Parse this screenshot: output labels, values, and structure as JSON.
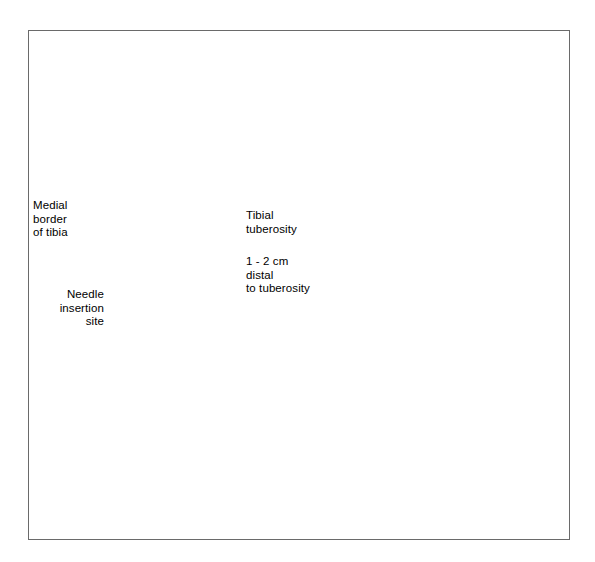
{
  "figure": {
    "domain": "medical-illustration",
    "border_color": "#6a6a6a",
    "background_color": "#ffffff",
    "ink_color": "#1a1a1a",
    "shade_color": "#9b9b9b",
    "device_color": "#8e8e8e"
  },
  "panels": {
    "left": {
      "name": "anterior-knee-landmarks",
      "description": "Shaded anterior view of the knee showing femoral condyles, patella and proximal tibia with the needle insertion landmark marked by an X."
    },
    "right": {
      "name": "flexed-leg-needle-placement",
      "description": "Line drawing of a flexed leg supported on a rolled towel with an intraosseous needle device seated on the proximal tibia."
    }
  },
  "markers": {
    "insertion_x": "X"
  },
  "labels": [
    {
      "id": "medial-border-of-tibia",
      "lines": [
        "Medial",
        "border",
        "of tibia"
      ],
      "align": "left",
      "x": 33,
      "y": 199
    },
    {
      "id": "needle-insertion-site",
      "lines": [
        "Needle",
        "insertion",
        "site"
      ],
      "align": "right",
      "x": 36,
      "y": 288
    },
    {
      "id": "tibial-tuberosity",
      "lines": [
        "Tibial",
        "tuberosity"
      ],
      "align": "left",
      "x": 246,
      "y": 209
    },
    {
      "id": "distance-distal-to-tuberosity",
      "lines": [
        "1 - 2 cm",
        "distal",
        "to tuberosity"
      ],
      "align": "left",
      "x": 246,
      "y": 255
    }
  ],
  "leader_lines": [
    {
      "id": "leader-medial-border",
      "from": [
        82,
        205
      ],
      "to": [
        172,
        219
      ]
    },
    {
      "id": "leader-needle-insertion",
      "from": [
        104,
        297
      ],
      "to": [
        170,
        232
      ]
    },
    {
      "id": "leader-tibial-tuberosity",
      "from": [
        240,
        214
      ],
      "to": [
        196,
        211
      ]
    },
    {
      "id": "leader-distance",
      "from": [
        240,
        259
      ],
      "to": [
        176,
        228
      ]
    }
  ]
}
